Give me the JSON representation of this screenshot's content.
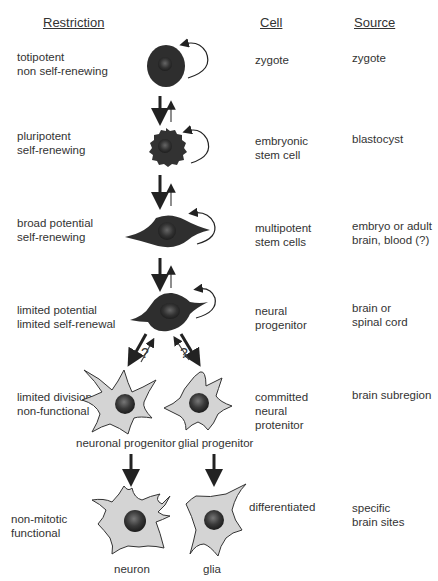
{
  "headers": {
    "restriction": "Restriction",
    "cell": "Cell",
    "source": "Source"
  },
  "stages": [
    {
      "restriction": [
        "totipotent",
        "non self-renewing"
      ],
      "cell": [
        "zygote"
      ],
      "source": [
        "zygote"
      ],
      "cell_icon": "zygote-cell-icon"
    },
    {
      "restriction": [
        "pluripotent",
        "self-renewing"
      ],
      "cell": [
        "embryonic",
        "stem cell"
      ],
      "source": [
        "blastocyst"
      ],
      "cell_icon": "embryonic-stem-cell-icon"
    },
    {
      "restriction": [
        "broad potential",
        "self-renewing"
      ],
      "cell": [
        "multipotent",
        "stem cells"
      ],
      "source": [
        "embryo or adult",
        "brain, blood (?)"
      ],
      "cell_icon": "multipotent-stem-cell-icon"
    },
    {
      "restriction": [
        "limited potential",
        "limited self-renewal"
      ],
      "cell": [
        "neural",
        "progenitor"
      ],
      "source": [
        "brain or",
        "spinal cord"
      ],
      "cell_icon": "neural-progenitor-cell-icon"
    },
    {
      "restriction": [
        "limited division",
        "non-functional"
      ],
      "cell": [
        "committed",
        "neural",
        "protenitor"
      ],
      "source": [
        "brain subregion"
      ],
      "cell_icon": "committed-progenitor-cell-icon"
    },
    {
      "restriction": [
        "non-mitotic",
        "functional"
      ],
      "cell": [
        "differentiated"
      ],
      "source": [
        "specific",
        "brain sites"
      ],
      "cell_icon": "differentiated-cell-icon"
    }
  ],
  "captions": {
    "neuronal_progenitor": "neuronal progenitor",
    "glial_progenitor": "glial progenitor",
    "neuron": "neuron",
    "glia": "glia"
  },
  "branch_marks": {
    "left": "?",
    "right": "?"
  },
  "colors": {
    "dark_cell": "#333333",
    "light_cell": "#d4d4d4",
    "nucleus": "#2a2a2a",
    "text": "#333333"
  }
}
